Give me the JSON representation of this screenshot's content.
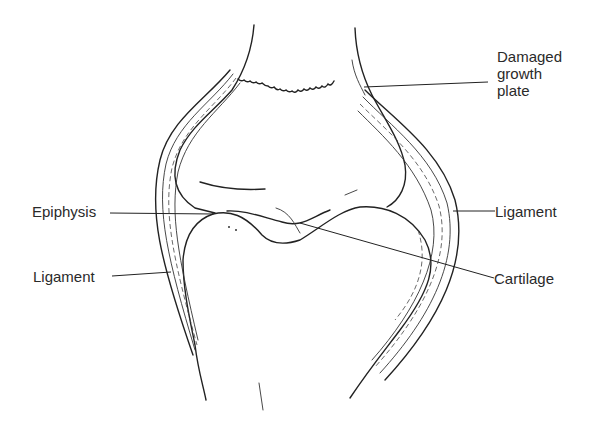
{
  "diagram": {
    "labels": [
      {
        "id": "damaged-growth-plate",
        "lines": [
          "Damaged",
          "growth",
          "plate"
        ]
      },
      {
        "id": "epiphysis",
        "text": "Epiphysis"
      },
      {
        "id": "ligament-right",
        "text": "Ligament"
      },
      {
        "id": "ligament-left",
        "text": "Ligament"
      },
      {
        "id": "cartilage",
        "text": "Cartilage"
      }
    ]
  },
  "colors": {
    "ink": "#222222",
    "background": "#ffffff"
  }
}
